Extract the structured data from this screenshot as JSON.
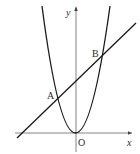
{
  "diagram": {
    "type": "coordinate-graph",
    "axes": {
      "x_label": "x",
      "y_label": "y",
      "origin_label": "O"
    },
    "points": [
      {
        "label": "A"
      },
      {
        "label": "B"
      }
    ],
    "colors": {
      "curve": "#1a1a1a",
      "axis": "#555555",
      "text": "#2a2a2a"
    }
  }
}
